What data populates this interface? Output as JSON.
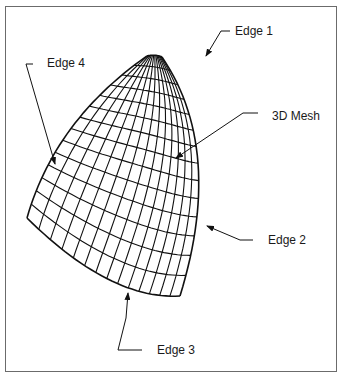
{
  "figure": {
    "type": "3D surface mesh with labeled edges",
    "border_color": "#6b6b6b",
    "line_color": "#111111",
    "labels": {
      "edge1": "Edge 1",
      "edge2": "Edge 2",
      "edge3": "Edge 3",
      "edge4": "Edge 4",
      "mesh": "3D Mesh"
    },
    "mesh": {
      "rows": 14,
      "cols": 14
    }
  }
}
